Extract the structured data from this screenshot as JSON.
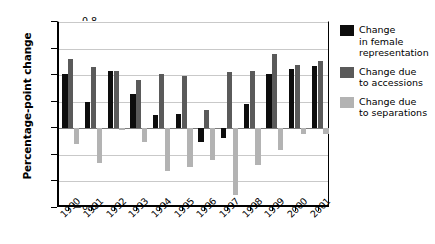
{
  "chart_data": {
    "type": "bar",
    "title": "",
    "xlabel": "",
    "ylabel": "Percentage-point change",
    "ylim": [
      -0.6,
      0.8
    ],
    "yticks": [
      "0.8",
      "0.6",
      "0.4",
      "0.2",
      "0",
      "−0.2",
      "−0.4",
      "−0.6"
    ],
    "ytick_values": [
      0.8,
      0.6,
      0.4,
      0.2,
      0,
      -0.2,
      -0.4,
      -0.6
    ],
    "grid": true,
    "legend_position": "right",
    "categories": [
      "1990",
      "1991",
      "1992",
      "1993",
      "1994",
      "1995",
      "1996",
      "1997",
      "1998",
      "1999",
      "2000",
      "2001"
    ],
    "series": [
      {
        "name": "Change in female representation",
        "legend_label_lines": [
          "Change",
          "in female",
          "representation"
        ],
        "color": "#0d0d0d",
        "values": [
          0.41,
          0.2,
          0.43,
          0.26,
          0.1,
          0.11,
          -0.1,
          -0.07,
          0.18,
          0.41,
          0.45,
          0.47
        ]
      },
      {
        "name": "Change due to accessions",
        "legend_label_lines": [
          "Change due",
          "to accessions"
        ],
        "color": "#5a5a5a",
        "values": [
          0.52,
          0.46,
          0.43,
          0.36,
          0.41,
          0.39,
          0.14,
          0.42,
          0.43,
          0.56,
          0.48,
          0.51
        ]
      },
      {
        "name": "Change due to separations",
        "legend_label_lines": [
          "Change due",
          "to separations"
        ],
        "color": "#b3b3b3",
        "values": [
          -0.12,
          -0.26,
          -0.01,
          -0.1,
          -0.32,
          -0.29,
          -0.24,
          -0.5,
          -0.28,
          -0.16,
          -0.04,
          -0.04
        ]
      }
    ]
  }
}
